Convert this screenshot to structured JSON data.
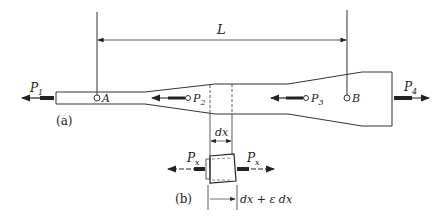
{
  "figure": {
    "part_a": {
      "label": "(a)",
      "dimension": {
        "label": "L"
      },
      "points": [
        {
          "name": "A"
        },
        {
          "name": "B"
        }
      ],
      "forces": [
        {
          "main": "P",
          "sub": "1",
          "direction": "left"
        },
        {
          "main": "P",
          "sub": "2",
          "direction": "left"
        },
        {
          "main": "P",
          "sub": "3",
          "direction": "left"
        },
        {
          "main": "P",
          "sub": "4",
          "direction": "right"
        }
      ]
    },
    "part_b": {
      "label": "(b)",
      "element_length": "dx",
      "deformed_length": "dx + ε dx",
      "force_left": {
        "main": "P",
        "sub": "x"
      },
      "force_right": {
        "main": "P",
        "sub": "x"
      }
    }
  },
  "colors": {
    "line": "#222222",
    "background": "#ffffff"
  }
}
